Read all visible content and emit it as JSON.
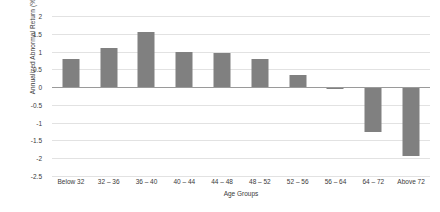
{
  "chart_data": {
    "type": "bar",
    "title": "",
    "xlabel": "Age Groups",
    "ylabel": "Annualized Abnormal Return (%)",
    "categories": [
      "Below 32",
      "32 – 36",
      "36 – 40",
      "40 – 44",
      "44 – 48",
      "48 – 52",
      "52 – 56",
      "56 – 64",
      "64 – 72",
      "Above 72"
    ],
    "values": [
      0.8,
      1.1,
      1.55,
      1.0,
      0.95,
      0.78,
      0.35,
      -0.05,
      -1.25,
      -1.95
    ],
    "ylim": [
      -2.5,
      2
    ],
    "yticks": [
      2,
      1.5,
      1,
      0.5,
      0,
      -0.5,
      -1,
      -1.5,
      -2,
      -2.5
    ],
    "ytick_labels": [
      "2",
      "1.5",
      "1",
      "0.5",
      "0",
      "-0.5",
      "-1",
      "-1.5",
      "-2",
      "-2.5"
    ],
    "grid": true,
    "legend": false,
    "bar_color": "#808080",
    "gridline_color": "#e2e2e2",
    "axis_color": "#9a9a9a",
    "text_color": "#3a3a3a"
  }
}
